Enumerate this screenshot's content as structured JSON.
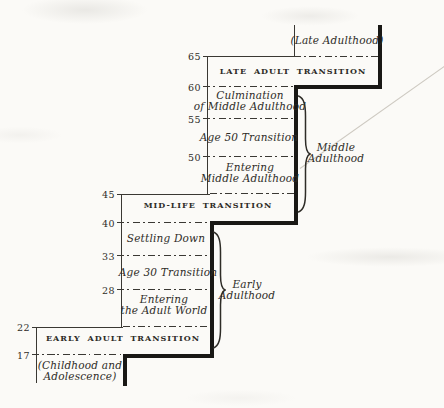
{
  "colors": {
    "paper": "#fbfaf7",
    "ink": "#2e2c27",
    "line": "#3a3833",
    "heavy": "#191815",
    "crease": "#cdc9c1"
  },
  "ages": [
    {
      "label": "65"
    },
    {
      "label": "60"
    },
    {
      "label": "55"
    },
    {
      "label": "50"
    },
    {
      "label": "45"
    },
    {
      "label": "40"
    },
    {
      "label": "33"
    },
    {
      "label": "28"
    },
    {
      "label": "22"
    },
    {
      "label": "17"
    }
  ],
  "stages": {
    "late_adulthood": "(Late Adulthood)",
    "late_adult_transition": "LATE ADULT TRANSITION",
    "culmination_of_middle_adulthood": "Culmination\nof Middle Adulthood",
    "age_50_transition": "Age 50 Transition",
    "entering_middle_adulthood": "Entering\nMiddle Adulthood",
    "mid_life_transition": "MID-LIFE TRANSITION",
    "settling_down": "Settling Down",
    "age_30_transition": "Age 30 Transition",
    "entering_the_adult_world": "Entering\nthe Adult World",
    "early_adult_transition": "EARLY ADULT TRANSITION",
    "childhood_and_adolescence": "(Childhood and\nAdolescence)"
  },
  "era_braces": {
    "middle_adulthood": "Middle\nAdulthood",
    "early_adulthood": "Early\nAdulthood"
  }
}
